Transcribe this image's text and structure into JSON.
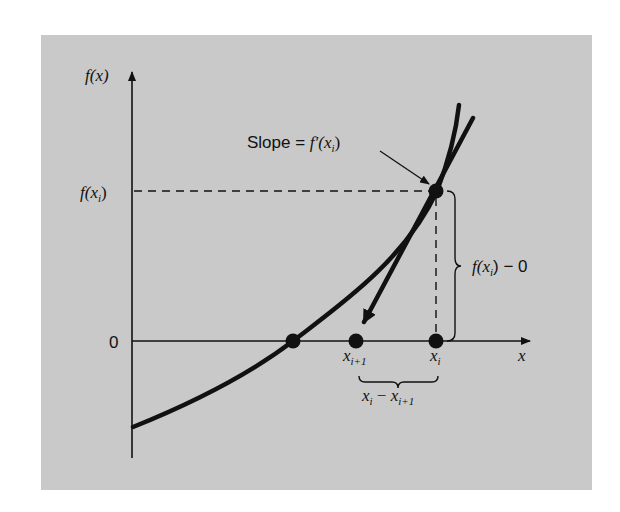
{
  "figure": {
    "background_color": "#c9c9c9",
    "ink_color": "#111111",
    "y_axis_label": "f(x)",
    "x_axis_label": "x",
    "y_ticks": [
      {
        "label_main": "f(x",
        "label_sub": "i",
        "label_tail": ")",
        "role": "f(x_i)"
      },
      {
        "label": "0",
        "role": "zero"
      }
    ],
    "slope_label": {
      "prefix": "Slope = ",
      "func": "f′(x",
      "sub": "i",
      "tail": ")"
    },
    "vertical_brace_label": {
      "func": "f(x",
      "sub": "i",
      "tail": ") − 0"
    },
    "x_points": [
      {
        "main": "x",
        "sub": "i+1",
        "role": "x_{i+1}"
      },
      {
        "main": "x",
        "sub": "i",
        "role": "x_i"
      }
    ],
    "horizontal_brace_label": {
      "a": "x",
      "a_sub": "i",
      "op": " − ",
      "b": "x",
      "b_sub": "i+1"
    },
    "elements": [
      "function-curve",
      "tangent-line",
      "root-point",
      "x-i-point",
      "x-i-plus-1-point",
      "f-xi-point"
    ]
  }
}
